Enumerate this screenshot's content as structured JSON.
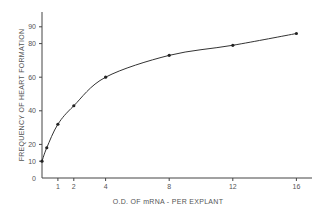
{
  "chart_data": {
    "type": "line",
    "title": "",
    "xlabel": "O.D. OF mRNA - PER EXPLANT",
    "ylabel": "FREQUENCY OF HEART FORMATION",
    "x_ticks": [
      1,
      2,
      4,
      8,
      12,
      16
    ],
    "y_ticks": [
      0,
      10,
      20,
      40,
      60,
      80,
      90
    ],
    "xlim": [
      0,
      16.5
    ],
    "ylim": [
      0,
      95
    ],
    "grid": false,
    "legend": null,
    "series": [
      {
        "name": "heart formation",
        "style": "points with smooth fitted curve",
        "x": [
          0,
          0.3,
          1,
          2,
          4,
          8,
          12,
          16
        ],
        "y": [
          10,
          18,
          32,
          43,
          60,
          73,
          79,
          86
        ]
      }
    ]
  },
  "colors": {
    "ink": "#333333",
    "background": "#ffffff"
  }
}
